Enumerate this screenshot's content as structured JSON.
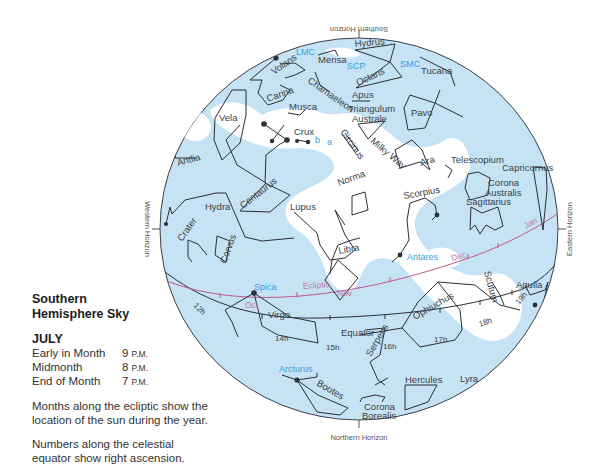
{
  "legend": {
    "title_line1": "Southern",
    "title_line2": "Hemisphere Sky",
    "month": "JULY",
    "times": [
      {
        "label": "Early in Month",
        "hour": "9",
        "suffix": "P.M."
      },
      {
        "label": "Midmonth",
        "hour": "8",
        "suffix": "P.M."
      },
      {
        "label": "End of Month",
        "hour": "7",
        "suffix": "P.M."
      }
    ],
    "note1": "Months along the ecliptic show the location of the sun during the year.",
    "note2": "Numbers along the celestial equator show right ascension."
  },
  "horizons": {
    "south": "Southern Horizon",
    "north": "Northern Horizon",
    "east": "Eastern Horizon",
    "west": "Western Horizon"
  },
  "colors": {
    "sky": "#c5e3f4",
    "milky_way": "#ffffff",
    "lines": "#2b2f36",
    "ecliptic": "#c0578f",
    "bright_star_label": "#3aa0dc",
    "month_label": "#c07aa8"
  },
  "constellations": {
    "hydrus": "Hydrus",
    "mensa": "Mensa",
    "volans": "Volans",
    "tucana": "Tucana",
    "octans": "Octans",
    "apus": "Apus",
    "chamaeleon": "Chamaeleon",
    "carina": "Carina",
    "musca": "Musca",
    "triangulum1": "Triangulum",
    "triangulum2": "Australe",
    "pavo": "Pavo",
    "vela": "Vela",
    "crux": "Crux",
    "circinus": "Circinus",
    "milky_way": "Milky Way",
    "ara": "Ara",
    "telescopium": "Telescopium",
    "capricornus": "Capricornus",
    "corona_a1": "Corona",
    "corona_a2": "Australis",
    "antlia": "Antlia",
    "norma": "Norma",
    "scorpius": "Scorpius",
    "sagittarius": "Sagittarius",
    "centaurus": "Centaurus",
    "lupus": "Lupus",
    "hydra": "Hydra",
    "crater": "Crater",
    "corvus": "Corvus",
    "libra": "Libra",
    "scutum": "Scutum",
    "aquila": "Aquila",
    "virgo": "Virgo",
    "ophiuchus": "Ophiuchus",
    "serpens": "Serpens",
    "bootes": "Bootes",
    "corona_b1": "Corona",
    "corona_b2": "Borealis",
    "hercules": "Hercules",
    "lyra": "Lyra"
  },
  "bright_objects": {
    "lmc": "LMC",
    "smc": "SMC",
    "scp": "SCP",
    "spica": "Spica",
    "antares": "Antares",
    "arcturus": "Arcturus",
    "alpha": "a",
    "beta": "b"
  },
  "lines": {
    "ecliptic": "Ecliptic",
    "equator": "Equator"
  },
  "months": {
    "oct": "Oct",
    "nov": "Nov",
    "dec": "Dec",
    "jan": "Jan"
  },
  "right_ascension": {
    "h12": "12h",
    "h14": "14h",
    "h15": "15h",
    "h16": "16h",
    "h17": "17h",
    "h18": "18h",
    "h19": "19h"
  }
}
